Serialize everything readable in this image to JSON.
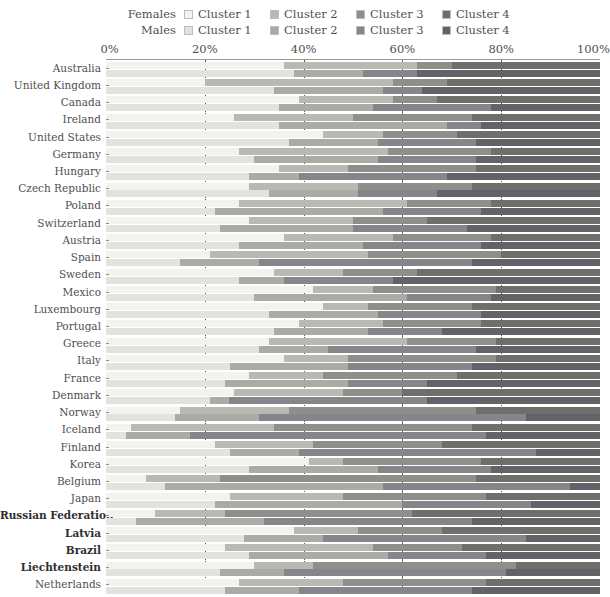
{
  "legend": {
    "rows": [
      {
        "series": "Females",
        "items": [
          {
            "label": "Cluster 1",
            "color": "#f2f2ee"
          },
          {
            "label": "Cluster 2",
            "color": "#b9b9b4"
          },
          {
            "label": "Cluster 3",
            "color": "#8e8e8a"
          },
          {
            "label": "Cluster 4",
            "color": "#6e6e6c"
          }
        ]
      },
      {
        "series": "Males",
        "items": [
          {
            "label": "Cluster 1",
            "color": "#e3e3dd"
          },
          {
            "label": "Cluster 2",
            "color": "#ababa6"
          },
          {
            "label": "Cluster 3",
            "color": "#86868a"
          },
          {
            "label": "Cluster 4",
            "color": "#626268"
          }
        ]
      }
    ]
  },
  "axis": {
    "ticks": [
      "0%",
      "20%",
      "40%",
      "60%",
      "80%",
      "100%"
    ],
    "tick_values": [
      0,
      20,
      40,
      60,
      80,
      100
    ],
    "gridlines": [
      20,
      40,
      60,
      80
    ]
  },
  "chart_data": {
    "type": "bar",
    "orientation": "horizontal",
    "stacked": true,
    "title": "",
    "xlabel": "",
    "ylabel": "",
    "xlim": [
      0,
      100
    ],
    "grid": true,
    "legend_position": "top",
    "series": [
      {
        "name": "Cluster 1",
        "color_female": "#f2f2ee",
        "color_male": "#e3e3dd"
      },
      {
        "name": "Cluster 2",
        "color_female": "#b9b9b4",
        "color_male": "#ababa6"
      },
      {
        "name": "Cluster 3",
        "color_female": "#8e8e8a",
        "color_male": "#86868a"
      },
      {
        "name": "Cluster 4",
        "color_female": "#6e6e6c",
        "color_male": "#626268"
      }
    ],
    "categories": [
      "Australia",
      "United Kingdom",
      "Canada",
      "Ireland",
      "United States",
      "Germany",
      "Hungary",
      "Czech Republic",
      "Poland",
      "Switzerland",
      "Austria",
      "Spain",
      "Sweden",
      "Mexico",
      "Luxembourg",
      "Portugal",
      "Greece",
      "Italy",
      "France",
      "Denmark",
      "Norway",
      "Iceland",
      "Finland",
      "Korea",
      "Belgium",
      "Japan",
      "Russian Federation",
      "Latvia",
      "Brazil",
      "Liechtenstein",
      "Netherlands"
    ],
    "bold_categories": [
      "Russian Federation",
      "Latvia",
      "Brazil",
      "Liechtenstein"
    ],
    "rows": [
      {
        "country": "Australia",
        "female": [
          36,
          27,
          7,
          30
        ],
        "male": [
          38,
          14,
          11,
          37
        ]
      },
      {
        "country": "United Kingdom",
        "female": [
          20,
          38,
          11,
          31
        ],
        "male": [
          34,
          22,
          8,
          36
        ]
      },
      {
        "country": "Canada",
        "female": [
          39,
          19,
          9,
          33
        ],
        "male": [
          35,
          19,
          24,
          22
        ]
      },
      {
        "country": "Ireland",
        "female": [
          26,
          24,
          24,
          26
        ],
        "male": [
          35,
          34,
          7,
          24
        ]
      },
      {
        "country": "United States",
        "female": [
          44,
          12,
          15,
          29
        ],
        "male": [
          37,
          18,
          20,
          25
        ]
      },
      {
        "country": "Germany",
        "female": [
          27,
          30,
          21,
          22
        ],
        "male": [
          30,
          25,
          20,
          25
        ]
      },
      {
        "country": "Hungary",
        "female": [
          35,
          14,
          26,
          25
        ],
        "male": [
          29,
          10,
          30,
          31
        ]
      },
      {
        "country": "Czech Republic",
        "female": [
          29,
          22,
          23,
          26
        ],
        "male": [
          33,
          18,
          16,
          33
        ]
      },
      {
        "country": "Poland",
        "female": [
          27,
          34,
          17,
          22
        ],
        "male": [
          22,
          34,
          20,
          24
        ]
      },
      {
        "country": "Switzerland",
        "female": [
          29,
          21,
          15,
          35
        ],
        "male": [
          23,
          27,
          23,
          27
        ]
      },
      {
        "country": "Austria",
        "female": [
          36,
          22,
          20,
          22
        ],
        "male": [
          27,
          25,
          24,
          24
        ]
      },
      {
        "country": "Spain",
        "female": [
          21,
          32,
          27,
          20
        ],
        "male": [
          15,
          16,
          43,
          26
        ]
      },
      {
        "country": "Sweden",
        "female": [
          34,
          14,
          15,
          37
        ],
        "male": [
          27,
          9,
          22,
          42
        ]
      },
      {
        "country": "Mexico",
        "female": [
          42,
          12,
          25,
          21
        ],
        "male": [
          30,
          31,
          17,
          22
        ]
      },
      {
        "country": "Luxembourg",
        "female": [
          44,
          9,
          21,
          26
        ],
        "male": [
          33,
          22,
          21,
          24
        ]
      },
      {
        "country": "Portugal",
        "female": [
          39,
          17,
          20,
          24
        ],
        "male": [
          34,
          19,
          15,
          32
        ]
      },
      {
        "country": "Greece",
        "female": [
          33,
          28,
          18,
          21
        ],
        "male": [
          31,
          14,
          30,
          25
        ]
      },
      {
        "country": "Italy",
        "female": [
          36,
          13,
          30,
          21
        ],
        "male": [
          25,
          24,
          25,
          26
        ]
      },
      {
        "country": "France",
        "female": [
          29,
          15,
          27,
          29
        ],
        "male": [
          24,
          25,
          16,
          35
        ]
      },
      {
        "country": "Denmark",
        "female": [
          26,
          22,
          12,
          40
        ],
        "male": [
          21,
          4,
          40,
          35
        ]
      },
      {
        "country": "Norway",
        "female": [
          15,
          22,
          38,
          25
        ],
        "male": [
          14,
          17,
          54,
          15
        ]
      },
      {
        "country": "Iceland",
        "female": [
          5,
          29,
          40,
          26
        ],
        "male": [
          4,
          13,
          60,
          23
        ]
      },
      {
        "country": "Finland",
        "female": [
          22,
          20,
          26,
          32
        ],
        "male": [
          25,
          14,
          48,
          13
        ]
      },
      {
        "country": "Korea",
        "female": [
          41,
          7,
          28,
          24
        ],
        "male": [
          29,
          26,
          23,
          22
        ]
      },
      {
        "country": "Belgium",
        "female": [
          8,
          15,
          52,
          25
        ],
        "male": [
          12,
          44,
          38,
          6
        ]
      },
      {
        "country": "Japan",
        "female": [
          25,
          23,
          29,
          23
        ],
        "male": [
          22,
          38,
          26,
          14
        ]
      },
      {
        "country": "Russian Federation",
        "female": [
          10,
          14,
          38,
          38
        ],
        "male": [
          6,
          26,
          42,
          26
        ]
      },
      {
        "country": "Latvia",
        "female": [
          38,
          13,
          17,
          32
        ],
        "male": [
          28,
          16,
          41,
          15
        ]
      },
      {
        "country": "Brazil",
        "female": [
          24,
          30,
          18,
          28
        ],
        "male": [
          29,
          28,
          20,
          23
        ]
      },
      {
        "country": "Liechtenstein",
        "female": [
          30,
          12,
          41,
          17
        ],
        "male": [
          23,
          13,
          45,
          19
        ]
      },
      {
        "country": "Netherlands",
        "female": [
          27,
          21,
          29,
          23
        ],
        "male": [
          24,
          15,
          35,
          26
        ]
      }
    ]
  }
}
